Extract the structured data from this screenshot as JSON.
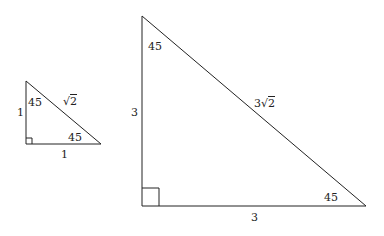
{
  "small_triangle": {
    "leg_vertical": "1",
    "leg_horizontal": "1",
    "hypotenuse": "√2",
    "hyp_radicand": "2",
    "angle_top": "45",
    "angle_right": "45"
  },
  "large_triangle": {
    "leg_vertical": "3",
    "leg_horizontal": "3",
    "hypotenuse": "3√2",
    "hyp_coef": "3",
    "hyp_radicand": "2",
    "angle_top": "45",
    "angle_right": "45"
  },
  "colors": {
    "stroke": "#222222",
    "background": "#ffffff"
  }
}
